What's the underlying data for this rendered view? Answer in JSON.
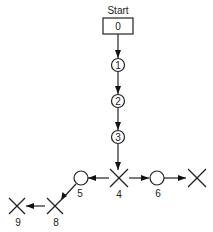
{
  "diagram": {
    "start_label": "Start",
    "nodes": [
      {
        "id": "0",
        "shape": "box",
        "label": "0",
        "x": 118,
        "y": 26
      },
      {
        "id": "1",
        "shape": "circle",
        "label": "1",
        "x": 118,
        "y": 65
      },
      {
        "id": "2",
        "shape": "circle",
        "label": "2",
        "x": 118,
        "y": 101
      },
      {
        "id": "3",
        "shape": "circle",
        "label": "3",
        "x": 118,
        "y": 137
      },
      {
        "id": "4",
        "shape": "cross",
        "label": "4",
        "x": 119,
        "y": 178
      },
      {
        "id": "5",
        "shape": "circle",
        "label": "5",
        "x": 81,
        "y": 178
      },
      {
        "id": "6",
        "shape": "circle",
        "label": "6",
        "x": 157,
        "y": 178
      },
      {
        "id": "7",
        "shape": "cross",
        "label": "",
        "x": 197,
        "y": 178
      },
      {
        "id": "8",
        "shape": "cross",
        "label": "8",
        "x": 55,
        "y": 206
      },
      {
        "id": "9",
        "shape": "cross",
        "label": "9",
        "x": 17,
        "y": 206
      }
    ],
    "edges": [
      {
        "from": "0",
        "to": "1"
      },
      {
        "from": "1",
        "to": "2"
      },
      {
        "from": "2",
        "to": "3"
      },
      {
        "from": "3",
        "to": "4"
      },
      {
        "from": "4",
        "to": "5"
      },
      {
        "from": "4",
        "to": "6"
      },
      {
        "from": "6",
        "to": "7"
      },
      {
        "from": "5",
        "to": "8"
      },
      {
        "from": "8",
        "to": "9"
      }
    ],
    "labels": {
      "n0": "0",
      "n1": "1",
      "n2": "2",
      "n3": "3",
      "n4": "4",
      "n5": "5",
      "n6": "6",
      "n8": "8",
      "n9": "9"
    }
  }
}
